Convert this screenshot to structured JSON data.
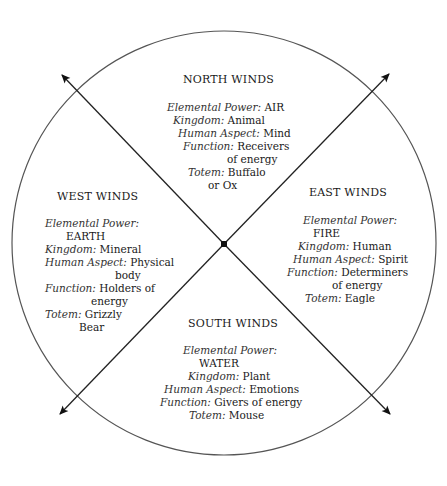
{
  "diagram": {
    "type": "medicine-wheel",
    "circle": {
      "cx": 224,
      "cy": 243,
      "r": 212,
      "stroke": "#555555"
    },
    "center_point": {
      "x": 224,
      "y": 244
    },
    "arrows": [
      {
        "direction": "north-west",
        "tip": [
          61,
          74
        ]
      },
      {
        "direction": "north-east",
        "tip": [
          390,
          73
        ]
      },
      {
        "direction": "south-west",
        "tip": [
          59,
          415
        ]
      },
      {
        "direction": "south-east",
        "tip": [
          391,
          415
        ]
      }
    ]
  },
  "north": {
    "title": "NORTH WINDS",
    "l1_label": "Elemental Power:",
    "l1_value": "AIR",
    "l2_label": "Kingdom:",
    "l2_value": "Animal",
    "l3_label": "Human Aspect:",
    "l3_value": "Mind",
    "l4_label": "Function:",
    "l4_value": "Receivers",
    "l4_cont": "of energy",
    "l5_label": "Totem:",
    "l5_value": "Buffalo",
    "l5_cont": "or Ox"
  },
  "west": {
    "title": "WEST WINDS",
    "l1_label": "Elemental Power:",
    "l1_cont": "EARTH",
    "l2_label": "Kingdom:",
    "l2_value": "Mineral",
    "l3_label": "Human Aspect:",
    "l3_value": "Physical",
    "l3_cont": "body",
    "l4_label": "Function:",
    "l4_value": "Holders of",
    "l4_cont": "energy",
    "l5_label": "Totem:",
    "l5_value": "Grizzly",
    "l5_cont": "Bear"
  },
  "east": {
    "title": "EAST WINDS",
    "l1_label": "Elemental Power:",
    "l1_cont": "FIRE",
    "l2_label": "Kingdom:",
    "l2_value": "Human",
    "l3_label": "Human Aspect:",
    "l3_value": "Spirit",
    "l4_label": "Function:",
    "l4_value": "Determiners",
    "l4_cont": "of energy",
    "l5_label": "Totem:",
    "l5_value": "Eagle"
  },
  "south": {
    "title": "SOUTH WINDS",
    "l1_label": "Elemental Power:",
    "l1_cont": "WATER",
    "l2_label": "Kingdom:",
    "l2_value": "Plant",
    "l3_label": "Human Aspect:",
    "l3_value": "Emotions",
    "l4_label": "Function:",
    "l4_value": "Givers of energy",
    "l5_label": "Totem:",
    "l5_value": "Mouse"
  }
}
